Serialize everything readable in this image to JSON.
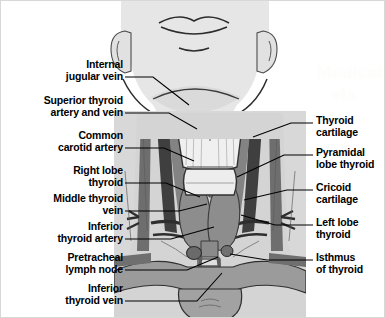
{
  "figure": {
    "background_color": "#ffffff",
    "border_color": "#d8d8d8",
    "label_color": "#000000",
    "leader_line_color": "#000000",
    "skin_color": "#e3e3e3",
    "body_color": "#d6d6d6",
    "vessel_dark": "#4a4a4a",
    "vessel_mid": "#7d7d7d",
    "cartilage_color": "#f2f2f2",
    "gland_color": "#9a9a9a"
  },
  "watermark": {
    "line1": "Medical",
    "line2": "ela"
  },
  "labels_left": [
    {
      "id": "internal-jugular-vein",
      "lines": [
        "Internal",
        "jugular vein"
      ],
      "x": 22,
      "y": 57,
      "w": 100,
      "lead": [
        [
          124,
          76
        ],
        [
          152,
          76
        ],
        [
          188,
          104
        ]
      ]
    },
    {
      "id": "superior-thyroid-artery-and-vein",
      "lines": [
        "Superior thyroid",
        "artery and vein"
      ],
      "x": 10,
      "y": 93,
      "w": 112,
      "lead": [
        [
          124,
          112
        ],
        [
          168,
          112
        ],
        [
          196,
          128
        ]
      ]
    },
    {
      "id": "common-carotid-artery",
      "lines": [
        "Common",
        "carotid artery"
      ],
      "x": 22,
      "y": 128,
      "w": 100,
      "lead": [
        [
          124,
          147
        ],
        [
          163,
          147
        ],
        [
          193,
          160
        ]
      ]
    },
    {
      "id": "right-lobe-thyroid",
      "lines": [
        "Right lobe",
        "thyroid"
      ],
      "x": 30,
      "y": 163,
      "w": 92,
      "lead": [
        [
          124,
          182
        ],
        [
          165,
          182
        ],
        [
          199,
          196
        ]
      ]
    },
    {
      "id": "middle-thyroid-vein",
      "lines": [
        "Middle thyroid",
        "vein"
      ],
      "x": 22,
      "y": 191,
      "w": 100,
      "lead": [
        [
          124,
          210
        ],
        [
          178,
          210
        ],
        [
          206,
          203
        ]
      ]
    },
    {
      "id": "inferior-thyroid-artery",
      "lines": [
        "Inferior",
        "thyroid artery"
      ],
      "x": 22,
      "y": 219,
      "w": 100,
      "lead": [
        [
          124,
          238
        ],
        [
          170,
          238
        ],
        [
          213,
          226
        ]
      ]
    },
    {
      "id": "pretracheal-lymph-node",
      "lines": [
        "Pretracheal",
        "lymph node"
      ],
      "x": 22,
      "y": 250,
      "w": 100,
      "lead": [
        [
          124,
          269
        ],
        [
          186,
          269
        ],
        [
          217,
          256
        ]
      ]
    },
    {
      "id": "inferior-thyroid-vein",
      "lines": [
        "Inferior",
        "thyroid vein"
      ],
      "x": 22,
      "y": 281,
      "w": 100,
      "lead": [
        [
          124,
          300
        ],
        [
          196,
          300
        ],
        [
          221,
          272
        ]
      ]
    }
  ],
  "labels_right": [
    {
      "id": "thyroid-cartilage",
      "lines": [
        "Thyroid",
        "cartilage"
      ],
      "x": 315,
      "y": 113,
      "w": 70,
      "lead": [
        [
          312,
          122
        ],
        [
          290,
          122
        ],
        [
          252,
          136
        ]
      ]
    },
    {
      "id": "pyramidal-lobe-thyroid",
      "lines": [
        "Pyramidal",
        "lobe thyroid"
      ],
      "x": 315,
      "y": 145,
      "w": 70,
      "lead": [
        [
          312,
          154
        ],
        [
          283,
          154
        ],
        [
          236,
          176
        ]
      ]
    },
    {
      "id": "cricoid-cartilage",
      "lines": [
        "Cricoid",
        "cartilage"
      ],
      "x": 315,
      "y": 180,
      "w": 70,
      "lead": [
        [
          312,
          189
        ],
        [
          286,
          189
        ],
        [
          243,
          199
        ]
      ]
    },
    {
      "id": "left-lobe-thyroid",
      "lines": [
        "Left lobe",
        "thyroid"
      ],
      "x": 315,
      "y": 215,
      "w": 70,
      "lead": [
        [
          312,
          224
        ],
        [
          274,
          224
        ],
        [
          240,
          214
        ]
      ]
    },
    {
      "id": "isthmus-of-thyroid",
      "lines": [
        "Isthmus",
        "of thyroid"
      ],
      "x": 315,
      "y": 250,
      "w": 70,
      "lead": [
        [
          312,
          259
        ],
        [
          266,
          259
        ],
        [
          229,
          253
        ]
      ]
    }
  ]
}
